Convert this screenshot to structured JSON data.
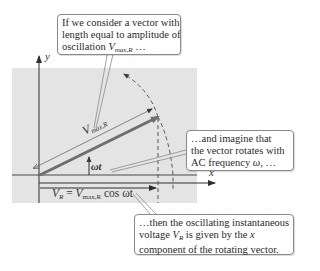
{
  "diagram": {
    "axes": {
      "x_label": "x",
      "y_label": "y"
    },
    "vector_label": {
      "main": "V",
      "sub": "max,R"
    },
    "angle_label": "ωt",
    "projection_formula": {
      "lhs": "V",
      "lhs_sub": "R",
      "eq": " = ",
      "rhs": "V",
      "rhs_sub": "max,R",
      "tail": " cos ωt"
    },
    "colors": {
      "panel": "#e4e4e4",
      "axis": "#3a3a3a",
      "vector": "#6e6e6e",
      "callout_border": "#8a8a8a"
    }
  },
  "callouts": [
    {
      "id": "amplitude",
      "lines": [
        "If we consider a vector with",
        "length equal to amplitude of",
        "oscillation "
      ],
      "math": {
        "main": "V",
        "sub": "max,R",
        "tail": " …"
      }
    },
    {
      "id": "rotation",
      "lines": [
        "…and imagine that",
        "the vector rotates with",
        "AC frequency "
      ],
      "math": {
        "main": "ω",
        "tail": ", …"
      }
    },
    {
      "id": "projection",
      "lines": [
        "…then the oscillating instantaneous",
        "voltage ",
        "component of the rotating vector."
      ],
      "math": {
        "main": "V",
        "sub": "R",
        "tail": " is given by the ",
        "var": "x"
      }
    }
  ]
}
